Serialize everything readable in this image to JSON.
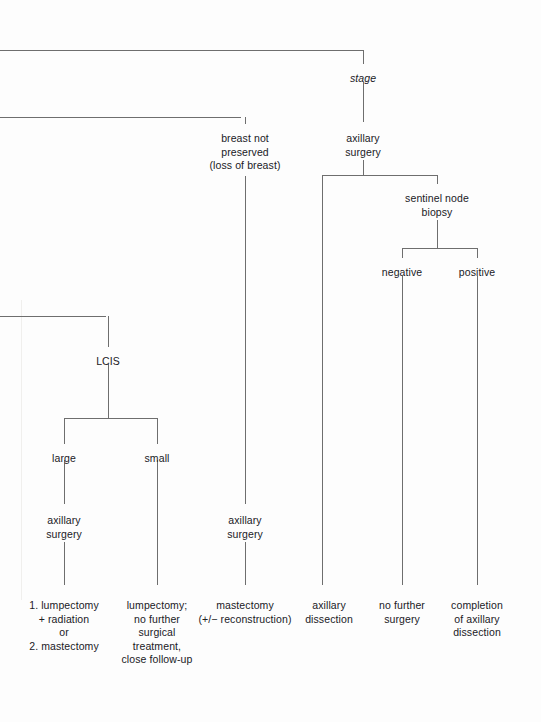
{
  "diagram": {
    "type": "decision-tree",
    "background_color": "#fdfdfd",
    "line_color": "#6e6e6e",
    "text_color": "#20201f",
    "nodes": [
      {
        "id": "stage",
        "label": "stage",
        "style": "italic",
        "x": 363,
        "y": 72
      },
      {
        "id": "breast-not-preserved",
        "label": "breast not\npreserved\n(loss of breast)",
        "style": "normal",
        "x": 245,
        "y": 132
      },
      {
        "id": "axillary-surgery-top",
        "label": "axillary\nsurgery",
        "style": "normal",
        "x": 363,
        "y": 132
      },
      {
        "id": "sentinel-node-biopsy",
        "label": "sentinel node\nbiopsy",
        "style": "normal",
        "x": 437,
        "y": 192
      },
      {
        "id": "negative",
        "label": "negative",
        "style": "normal",
        "x": 402,
        "y": 266
      },
      {
        "id": "positive",
        "label": "positive",
        "style": "normal",
        "x": 477,
        "y": 266
      },
      {
        "id": "lcis",
        "label": "LCIS",
        "style": "normal",
        "x": 108,
        "y": 355
      },
      {
        "id": "large",
        "label": "large",
        "style": "normal",
        "x": 64,
        "y": 452
      },
      {
        "id": "small",
        "label": "small",
        "style": "normal",
        "x": 157,
        "y": 452
      },
      {
        "id": "axillary-surgery-left",
        "label": "axillary\nsurgery",
        "style": "normal",
        "x": 64,
        "y": 514
      },
      {
        "id": "axillary-surgery-mid",
        "label": "axillary\nsurgery",
        "style": "normal",
        "x": 245,
        "y": 514
      },
      {
        "id": "leaf-lumpectomy-rad",
        "label": "1. lumpectomy\n+ radiation\nor\n2. mastectomy",
        "style": "normal",
        "x": 64,
        "y": 599
      },
      {
        "id": "leaf-lumpectomy-fu",
        "label": "lumpectomy;\nno further\nsurgical\ntreatment,\nclose follow-up",
        "style": "normal",
        "x": 157,
        "y": 599
      },
      {
        "id": "leaf-mastectomy",
        "label": "mastectomy\n(+/− reconstruction)",
        "style": "normal",
        "x": 245,
        "y": 599
      },
      {
        "id": "leaf-axillary-diss",
        "label": "axillary\ndissection",
        "style": "normal",
        "x": 329,
        "y": 599
      },
      {
        "id": "leaf-no-further",
        "label": "no further\nsurgery",
        "style": "normal",
        "x": 402,
        "y": 599
      },
      {
        "id": "leaf-completion",
        "label": "completion\nof axillary\ndissection",
        "style": "normal",
        "x": 477,
        "y": 599
      }
    ],
    "edges": [
      {
        "id": "trunk-top-horizontal",
        "type": "horizontal",
        "x1": 0,
        "x2": 363,
        "y": 51,
        "y2": 50
      },
      {
        "id": "stage-stem",
        "type": "vertical",
        "x": 363,
        "y1": 50,
        "y2": 64
      },
      {
        "id": "stage-to-axillary",
        "type": "vertical",
        "x": 363,
        "y1": 82,
        "y2": 122
      },
      {
        "id": "second-horizontal",
        "type": "horizontal",
        "x1": 0,
        "x2": 245,
        "y": 118,
        "y2": 117
      },
      {
        "id": "breast-not-pres-stem",
        "type": "vertical",
        "x": 245,
        "y1": 117,
        "y2": 124
      },
      {
        "id": "breast-not-pres-down",
        "type": "vertical",
        "x": 245,
        "y1": 176,
        "y2": 504
      },
      {
        "id": "axsurg-branch-stem",
        "type": "vertical",
        "x": 363,
        "y1": 160,
        "y2": 175
      },
      {
        "id": "axsurg-branch-bar",
        "type": "horizontal",
        "x1": 322,
        "x2": 437,
        "y": 175,
        "y2": 175
      },
      {
        "id": "axsurg-left-down",
        "type": "vertical",
        "x": 322,
        "y1": 175,
        "y2": 585
      },
      {
        "id": "axsurg-right-to-sentinel",
        "type": "vertical",
        "x": 437,
        "y1": 175,
        "y2": 184
      },
      {
        "id": "sentinel-stem",
        "type": "vertical",
        "x": 437,
        "y1": 220,
        "y2": 248
      },
      {
        "id": "sentinel-branch-bar",
        "type": "horizontal",
        "x1": 402,
        "x2": 477,
        "y": 248,
        "y2": 248
      },
      {
        "id": "negative-stem",
        "type": "vertical",
        "x": 402,
        "y1": 248,
        "y2": 258
      },
      {
        "id": "negative-down",
        "type": "vertical",
        "x": 402,
        "y1": 276,
        "y2": 585
      },
      {
        "id": "positive-stem",
        "type": "vertical",
        "x": 477,
        "y1": 248,
        "y2": 258
      },
      {
        "id": "positive-down",
        "type": "vertical",
        "x": 477,
        "y1": 276,
        "y2": 585
      },
      {
        "id": "lcis-horizontal",
        "type": "horizontal",
        "x1": 0,
        "x2": 108,
        "y": 317,
        "y2": 316
      },
      {
        "id": "lcis-stem",
        "type": "vertical",
        "x": 108,
        "y1": 316,
        "y2": 347
      },
      {
        "id": "lcis-down",
        "type": "vertical",
        "x": 108,
        "y1": 364,
        "y2": 418
      },
      {
        "id": "lcis-branch-bar",
        "type": "horizontal",
        "x1": 64,
        "x2": 157,
        "y": 418,
        "y2": 418
      },
      {
        "id": "large-stem",
        "type": "vertical",
        "x": 64,
        "y1": 418,
        "y2": 444
      },
      {
        "id": "large-down",
        "type": "vertical",
        "x": 64,
        "y1": 460,
        "y2": 504
      },
      {
        "id": "large-to-leaf",
        "type": "vertical",
        "x": 64,
        "y1": 542,
        "y2": 585
      },
      {
        "id": "small-stem",
        "type": "vertical",
        "x": 157,
        "y1": 418,
        "y2": 444
      },
      {
        "id": "small-down",
        "type": "vertical",
        "x": 157,
        "y1": 460,
        "y2": 585
      },
      {
        "id": "mid-axsurg-to-leaf",
        "type": "vertical",
        "x": 245,
        "y1": 542,
        "y2": 585
      }
    ]
  }
}
